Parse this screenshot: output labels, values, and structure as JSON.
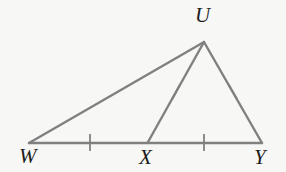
{
  "figure": {
    "kind": "geometry-diagram",
    "background_color": "#f7f7f5",
    "stroke_color": "#808080",
    "label_color": "#1c1c1c",
    "stroke_width": 2.4,
    "width": 286,
    "height": 172
  },
  "labels": {
    "U": "U",
    "W": "W",
    "X": "X",
    "Y": "Y"
  },
  "points": {
    "U": {
      "x": 204,
      "y": 42
    },
    "W": {
      "x": 29,
      "y": 143
    },
    "X": {
      "x": 148,
      "y": 142
    },
    "Y": {
      "x": 262,
      "y": 143
    }
  },
  "segments": [
    {
      "name": "WU",
      "from": "W",
      "to": "U",
      "ticks": 0
    },
    {
      "name": "UY",
      "from": "U",
      "to": "Y",
      "ticks": 1
    },
    {
      "name": "UX",
      "from": "U",
      "to": "X",
      "ticks": 1
    },
    {
      "name": "WX",
      "from": "W",
      "to": "X",
      "ticks": 1
    },
    {
      "name": "XY",
      "from": "X",
      "to": "Y",
      "ticks": 1
    }
  ],
  "tick_marks": [
    {
      "segment": "WX",
      "cx": 90,
      "cy": 142.5,
      "angle_deg": 90,
      "length": 17
    },
    {
      "segment": "XY",
      "cx": 204,
      "cy": 142.5,
      "angle_deg": 90,
      "length": 17
    },
    {
      "segment": "UX",
      "cx": 176,
      "cy": 92,
      "angle_deg": 118,
      "length": 17
    },
    {
      "segment": "UY",
      "cx": 233,
      "cy": 92,
      "angle_deg": 60,
      "length": 17
    }
  ]
}
